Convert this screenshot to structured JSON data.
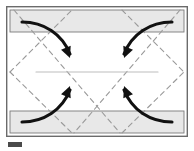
{
  "figure": {
    "caption_label": "Fig.",
    "colors": {
      "paper_fill": "#ffffff",
      "flap_fill": "#e8e8e8",
      "outline": "#4a4a4a",
      "frame": "#6b6b6b",
      "fold_line": "#9a9a9a",
      "arrow": "#111111",
      "center_line": "#bdbdbd",
      "background": "#ffffff"
    },
    "frame": {
      "x": 6,
      "y": 6,
      "width": 182,
      "height": 131,
      "stroke_width": 1.4
    },
    "top_flap": {
      "label": "top-flap",
      "x": 10,
      "y": 10,
      "width": 174,
      "height": 22
    },
    "bottom_flap": {
      "label": "bottom-flap",
      "x": 10,
      "y": 111,
      "width": 174,
      "height": 22
    },
    "center_line": {
      "label": "center-crease",
      "x1": 36,
      "y1": 72,
      "x2": 158,
      "y2": 72
    },
    "fold_lines": [
      {
        "name": "fold-top-left",
        "x1": 10,
        "y1": 72,
        "x2": 72,
        "y2": 10
      },
      {
        "name": "fold-top-right",
        "x1": 122,
        "y1": 10,
        "x2": 184,
        "y2": 72
      },
      {
        "name": "fold-bottom-left",
        "x1": 10,
        "y1": 72,
        "x2": 72,
        "y2": 133
      },
      {
        "name": "fold-bottom-right",
        "x1": 122,
        "y1": 133,
        "x2": 184,
        "y2": 72
      },
      {
        "name": "fold-diagonal-down-long",
        "x1": 14,
        "y1": 10,
        "x2": 120,
        "y2": 133
      },
      {
        "name": "fold-diagonal-up-long",
        "x1": 180,
        "y1": 10,
        "x2": 74,
        "y2": 133
      }
    ],
    "arrows": [
      {
        "name": "arrow-top-left",
        "direction": "down-right",
        "path": "M 22 22 C 44 22, 62 34, 70 54",
        "tip": {
          "x": 70,
          "y": 58,
          "angle": 68
        }
      },
      {
        "name": "arrow-top-right",
        "direction": "down-left",
        "path": "M 172 22 C 150 22, 132 34, 124 54",
        "tip": {
          "x": 124,
          "y": 58,
          "angle": 112
        }
      },
      {
        "name": "arrow-bottom-left",
        "direction": "up-right",
        "path": "M 22 122 C 44 122, 62 110, 70 90",
        "tip": {
          "x": 70,
          "y": 86,
          "angle": -68
        }
      },
      {
        "name": "arrow-bottom-right",
        "direction": "up-left",
        "path": "M 172 122 C 150 122, 132 110, 124 90",
        "tip": {
          "x": 124,
          "y": 86,
          "angle": -112
        }
      }
    ]
  }
}
